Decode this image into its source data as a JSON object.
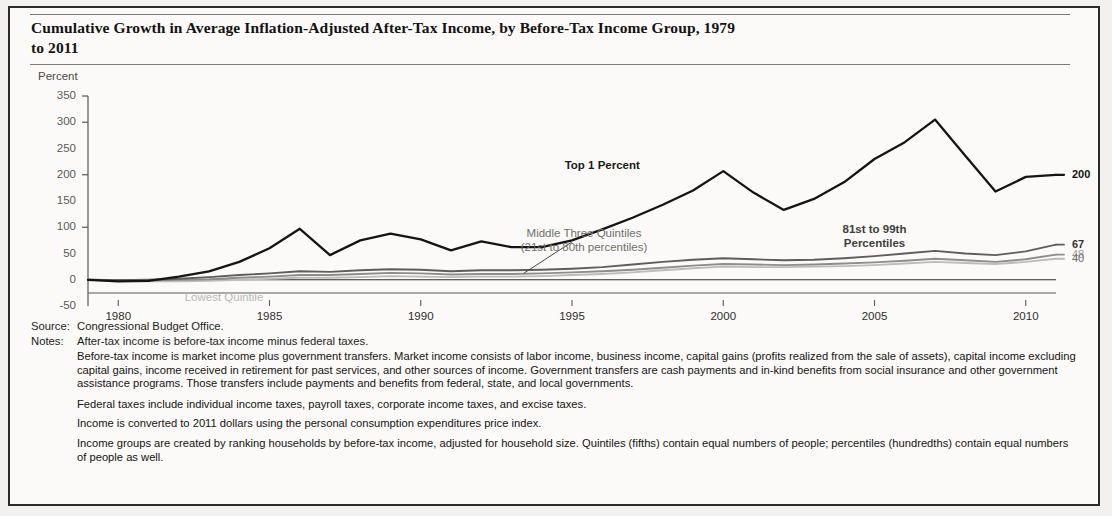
{
  "title": "Cumulative Growth in Average Inflation-Adjusted After-Tax Income, by Before-Tax Income Group, 1979 to 2011",
  "axis_unit_label": "Percent",
  "source": {
    "key": "Source:",
    "value": "Congressional Budget Office."
  },
  "notes": {
    "key": "Notes:",
    "first": "After-tax income is before-tax income minus federal taxes.",
    "paragraphs": [
      "Before-tax income is market income plus government transfers. Market income consists of labor income, business income, capital gains (profits realized from the sale of assets), capital income excluding capital gains, income received in retirement for past services, and other sources of income. Government transfers are cash payments and in-kind benefits from social insurance and other government assistance programs. Those transfers include payments and benefits from federal, state, and local governments.",
      "Federal taxes include individual income taxes, payroll taxes, corporate income taxes, and excise taxes.",
      "Income is converted to 2011 dollars using the personal consumption expenditures price index.",
      "Income groups are created by ranking households by before-tax income, adjusted for household size. Quintiles (fifths) contain equal numbers of people; percentiles (hundredths) contain equal numbers of people as well."
    ]
  },
  "annotations": {
    "top1": "Top 1 Percent",
    "middle_three_line1": "Middle Three Quintiles",
    "middle_three_line2": "(21st to 80th percentiles)",
    "pct81_line1": "81st to 99th",
    "pct81_line2": "Percentiles",
    "lowest": "Lowest Quintile"
  },
  "end_labels": {
    "top1": "200",
    "pct81": "67",
    "middle": "48",
    "lowest": "40"
  },
  "colors": {
    "top1": "#141414",
    "pct81": "#5e5d5b",
    "middle": "#8e8d8b",
    "lowest": "#bdbcba",
    "axis": "#5a5957",
    "frame": "#2b2b2b"
  },
  "chart_data": {
    "type": "line",
    "title": "Cumulative Growth in Average Inflation-Adjusted After-Tax Income, by Before-Tax Income Group, 1979 to 2011",
    "xlabel": "",
    "ylabel": "Percent",
    "xlim": [
      1979,
      2011
    ],
    "ylim": [
      -50,
      350
    ],
    "ytick_labels": [
      "350",
      "300",
      "250",
      "200",
      "150",
      "100",
      "50",
      "0",
      "-50"
    ],
    "yticks": [
      350,
      300,
      250,
      200,
      150,
      100,
      50,
      0,
      -50
    ],
    "xticks": [
      1980,
      1985,
      1990,
      1995,
      2000,
      2005,
      2010
    ],
    "xtick_labels": [
      "1980",
      "1985",
      "1990",
      "1995",
      "2000",
      "2005",
      "2010"
    ],
    "grid": false,
    "legend": "annotated-inline",
    "x": [
      1979,
      1980,
      1981,
      1982,
      1983,
      1984,
      1985,
      1986,
      1987,
      1988,
      1989,
      1990,
      1991,
      1992,
      1993,
      1994,
      1995,
      1996,
      1997,
      1998,
      1999,
      2000,
      2001,
      2002,
      2003,
      2004,
      2005,
      2006,
      2007,
      2008,
      2009,
      2010,
      2011
    ],
    "series": [
      {
        "name": "Top 1 Percent",
        "color": "#141414",
        "end_label": "200",
        "values": [
          0,
          -3,
          -2,
          6,
          16,
          34,
          60,
          97,
          47,
          75,
          88,
          77,
          56,
          73,
          62,
          62,
          75,
          96,
          118,
          143,
          170,
          207,
          166,
          133,
          154,
          186,
          230,
          262,
          305,
          236,
          168,
          196,
          200
        ]
      },
      {
        "name": "81st to 99th Percentiles",
        "color": "#5e5d5b",
        "end_label": "67",
        "values": [
          0,
          -1,
          0,
          2,
          5,
          9,
          12,
          16,
          15,
          18,
          20,
          19,
          16,
          18,
          18,
          19,
          21,
          24,
          29,
          34,
          38,
          41,
          39,
          37,
          38,
          41,
          45,
          50,
          55,
          50,
          47,
          54,
          67
        ]
      },
      {
        "name": "Middle Three Quintiles (21st to 80th percentiles)",
        "color": "#8e8d8b",
        "end_label": "48",
        "values": [
          0,
          -1,
          -1,
          0,
          1,
          4,
          6,
          9,
          9,
          11,
          13,
          12,
          10,
          11,
          11,
          12,
          14,
          16,
          19,
          23,
          27,
          30,
          29,
          28,
          29,
          31,
          33,
          36,
          40,
          37,
          34,
          39,
          48
        ]
      },
      {
        "name": "Lowest Quintile",
        "color": "#bdbcba",
        "end_label": "40",
        "values": [
          0,
          -2,
          -3,
          -3,
          -2,
          0,
          2,
          4,
          4,
          5,
          7,
          6,
          5,
          6,
          6,
          7,
          9,
          11,
          14,
          18,
          22,
          25,
          24,
          24,
          25,
          26,
          28,
          31,
          34,
          32,
          30,
          34,
          40
        ]
      }
    ]
  }
}
